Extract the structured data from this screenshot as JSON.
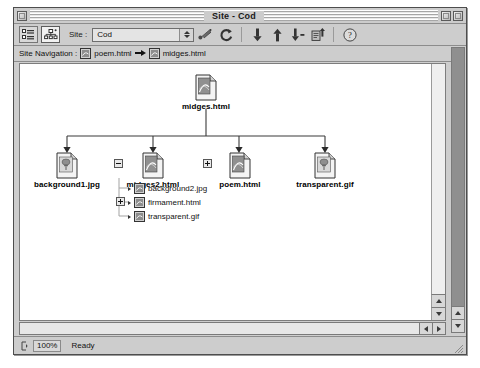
{
  "window": {
    "title": "Site - Cod",
    "close_button": "close-box",
    "zoom_button": "zoom-box",
    "collapse_button": "collapse-box"
  },
  "toolbar": {
    "view_list_label": "list-view",
    "view_navigation_label": "navigation-view",
    "site_label": "Site :",
    "site_popup_value": "Cod",
    "items": [
      {
        "name": "connect-icon",
        "glyph": "link"
      },
      {
        "name": "refresh-icon",
        "glyph": "C"
      },
      {
        "name": "download-icon",
        "glyph": "down"
      },
      {
        "name": "upload-icon",
        "glyph": "up"
      },
      {
        "name": "incremental-download-icon",
        "glyph": "down-dash"
      },
      {
        "name": "publish-icon",
        "glyph": "page-up"
      },
      {
        "name": "help-icon",
        "glyph": "?"
      }
    ]
  },
  "navbar": {
    "label": "Site Navigation :",
    "crumbs": [
      {
        "icon": "html-page-icon",
        "label": "poem.html"
      },
      {
        "icon": "html-page-icon",
        "label": "midges.html"
      }
    ],
    "separator": "arrow-right"
  },
  "tree": {
    "root": {
      "label": "midges.html",
      "icon": "html-page-icon"
    },
    "children": [
      {
        "label": "background1.jpg",
        "icon": "image-file-icon",
        "expander": "none"
      },
      {
        "label": "midges2.html",
        "icon": "html-page-icon",
        "expander": "minus"
      },
      {
        "label": "poem.html",
        "icon": "html-page-icon",
        "expander": "plus"
      },
      {
        "label": "transparent.gif",
        "icon": "image-file-icon",
        "expander": "none"
      }
    ],
    "sub_items": [
      {
        "label": "background2.jpg",
        "icon": "small-page-icon",
        "expander": "none"
      },
      {
        "label": "firmament.html",
        "icon": "small-page-icon",
        "expander": "plus"
      },
      {
        "label": "transparent.gif",
        "icon": "small-page-icon",
        "expander": "none"
      }
    ]
  },
  "statusbar": {
    "zoom_value": "100%",
    "status_text": "Ready"
  },
  "colors": {
    "window_chrome": "#cdcdcd",
    "canvas": "#ffffff",
    "frame_border": "#4d4d4d",
    "text": "#111111"
  }
}
